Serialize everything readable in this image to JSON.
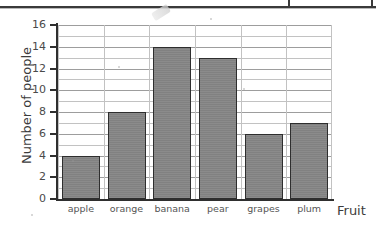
{
  "chart_data": {
    "type": "bar",
    "title": "",
    "xlabel": "Fruit",
    "ylabel": "Number of people",
    "categories": [
      "apple",
      "orange",
      "banana",
      "pear",
      "grapes",
      "plum"
    ],
    "values": [
      4,
      8,
      14,
      13,
      6,
      7
    ],
    "ylim": [
      0,
      16
    ],
    "ytick_step": 2,
    "yticks": [
      0,
      2,
      4,
      6,
      8,
      10,
      12,
      14,
      16
    ],
    "ytick_labels": [
      "0",
      "2",
      "4",
      "6",
      "8",
      "10",
      "12",
      "14",
      "16"
    ],
    "gridline_step": 1,
    "grid": true,
    "legend": false,
    "bar_color": "#858585",
    "bar_border_color": "#2e2e2e",
    "grid_color": "#c2c2c2",
    "axis_color": "#2f2f2f"
  },
  "axis": {
    "y_title": "Number of people",
    "x_title": "Fruit"
  }
}
